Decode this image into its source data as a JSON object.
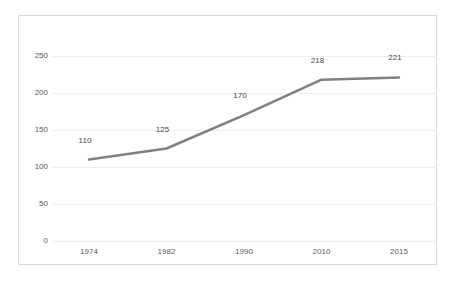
{
  "chart_data": {
    "type": "line",
    "title": "",
    "subtitle": "",
    "xlabel": "",
    "ylabel": "",
    "categories": [
      "1974",
      "1982",
      "1990",
      "2010",
      "2015"
    ],
    "values": [
      110,
      125,
      170,
      218,
      221
    ],
    "point_labels": [
      "110",
      "125",
      "170",
      "218",
      "221"
    ],
    "series": [
      {
        "name": "",
        "values": [
          110,
          125,
          170,
          218,
          221
        ]
      }
    ],
    "yticks": [
      0,
      50,
      100,
      150,
      200,
      250
    ],
    "ytick_labels": [
      "0",
      "50",
      "100",
      "150",
      "200",
      "250"
    ],
    "ylim": [
      0,
      250
    ],
    "grid": "horizontal",
    "legend": "none",
    "colors": {
      "line": "#808080",
      "gridline": "#eeeeee",
      "border": "#d9d9d9",
      "tick_text": "#595959",
      "label_text": "#3f3f3f",
      "background": "#ffffff"
    }
  }
}
